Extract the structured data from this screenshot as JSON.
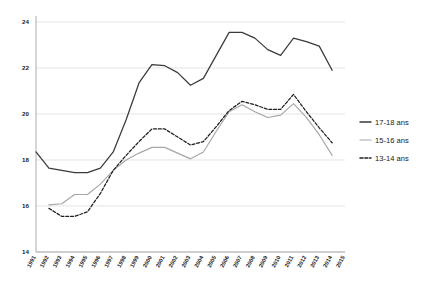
{
  "chart_data": {
    "type": "line",
    "title": "",
    "subtitle": "",
    "xlabel": "",
    "ylabel": "",
    "x": [
      "1991",
      "1992",
      "1993",
      "1994",
      "1995",
      "1996",
      "1997",
      "1998",
      "1999",
      "2000",
      "2001",
      "2002",
      "2003",
      "2004",
      "2005",
      "2006",
      "2007",
      "2008",
      "2009",
      "2010",
      "2011",
      "2012",
      "2013",
      "2014",
      "2015"
    ],
    "categories": [
      "1991",
      "1992",
      "1993",
      "1994",
      "1995",
      "1996",
      "1997",
      "1998",
      "1999",
      "2000",
      "2001",
      "2002",
      "2003",
      "2004",
      "2005",
      "2006",
      "2007",
      "2008",
      "2009",
      "2010",
      "2011",
      "2012",
      "2013",
      "2014",
      "2015"
    ],
    "xlim": [
      "1991",
      "2015"
    ],
    "ylim": [
      14,
      24
    ],
    "yticks": [
      14,
      16,
      18,
      20,
      22,
      24
    ],
    "grid": true,
    "legend_position": "right",
    "series": [
      {
        "name": "17-18 ans",
        "color": "#3a3a3a",
        "style": "solid",
        "values": [
          18.35,
          17.65,
          17.55,
          17.45,
          17.45,
          17.65,
          18.35,
          19.75,
          21.35,
          22.15,
          22.1,
          21.8,
          21.25,
          21.55,
          22.55,
          23.55,
          23.55,
          23.3,
          22.8,
          22.55,
          23.3,
          23.15,
          22.95,
          21.9,
          null
        ]
      },
      {
        "name": "15-16 ans",
        "color": "#a6a6a6",
        "style": "solid",
        "values": [
          null,
          16.05,
          16.1,
          16.5,
          16.5,
          16.95,
          17.55,
          18.0,
          18.3,
          18.55,
          18.55,
          18.3,
          18.05,
          18.35,
          19.25,
          20.1,
          20.4,
          20.1,
          19.85,
          19.95,
          20.45,
          19.85,
          19.1,
          18.2,
          null
        ]
      },
      {
        "name": "13-14 ans",
        "color": "#1f1f1f",
        "style": "dashed",
        "values": [
          null,
          15.9,
          15.55,
          15.55,
          15.75,
          16.55,
          17.55,
          18.2,
          18.8,
          19.35,
          19.35,
          19.0,
          18.65,
          18.8,
          19.45,
          20.15,
          20.55,
          20.4,
          20.2,
          20.2,
          20.85,
          20.1,
          19.4,
          18.75,
          null
        ]
      }
    ]
  },
  "legend": {
    "items": [
      {
        "label": "17-18 ans"
      },
      {
        "label": "15-16 ans"
      },
      {
        "label": "13-14 ans"
      }
    ]
  }
}
